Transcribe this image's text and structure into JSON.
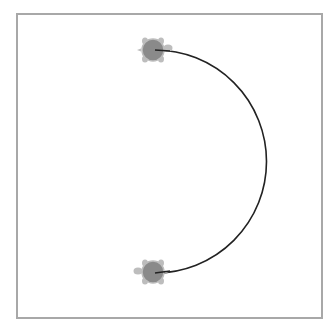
{
  "canvas": {
    "background": "#ffffff",
    "border_color": "#a8a8a8",
    "frame": {
      "x": 16,
      "y": 13,
      "width": 305,
      "height": 304
    }
  },
  "drawing": {
    "type": "turtle-graphics",
    "path": {
      "shape": "semicircle",
      "start": [
        155,
        273
      ],
      "end": [
        155,
        50
      ],
      "radius": 111.5,
      "sweep_side": "right",
      "stroke_color": "#222222",
      "stroke_width": 1.6
    },
    "turtles": [
      {
        "name": "turtle-top",
        "center": [
          153,
          50
        ],
        "heading": "right",
        "shell_color": "#8a8a8a",
        "body_color": "#bdbdbd"
      },
      {
        "name": "turtle-bottom",
        "center": [
          153,
          272
        ],
        "heading": "left",
        "shell_color": "#8a8a8a",
        "body_color": "#bdbdbd"
      }
    ]
  }
}
